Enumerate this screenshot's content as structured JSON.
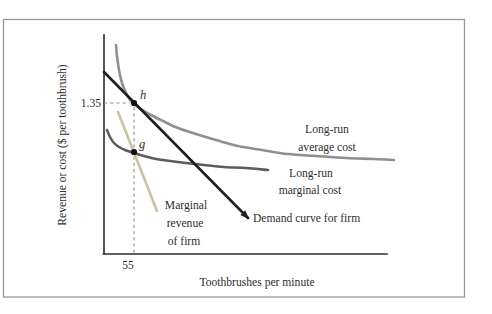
{
  "figure": {
    "y_axis_label": "Revenue or cost ($ per toothbrush)",
    "x_axis_label": "Toothbrushes per minute",
    "y_tick_label": "1.35",
    "x_tick_label": "55"
  },
  "labels": {
    "lrac": [
      "Long-run",
      "average cost"
    ],
    "lrmc": [
      "Long-run",
      "marginal cost"
    ],
    "demand": "Demand curve for firm",
    "mr": [
      "Marginal",
      "revenue",
      "of firm"
    ],
    "point_h": "h",
    "point_g": "g"
  },
  "colors": {
    "frame": "#999999",
    "axis": "#2b2b2b",
    "text": "#2e2e2e",
    "demand": "#1f1f1f",
    "lrac": "#8f8f8f",
    "lrmc": "#5c5c5c",
    "mr": "#c9c3a4",
    "dashed": "#8f8f8f",
    "dot": "#111111"
  },
  "chart_data": {
    "type": "line",
    "title": "",
    "xlabel": "Toothbrushes per minute",
    "ylabel": "Revenue or cost ($ per toothbrush)",
    "x_tick_values": [
      55
    ],
    "y_tick_values": [
      1.35
    ],
    "legend_position": "inline-annotations",
    "grid": false,
    "key_points": [
      {
        "label": "h",
        "x": 55,
        "y": 1.35,
        "px": [
          134,
          103
        ]
      },
      {
        "label": "g",
        "x": 55,
        "px": [
          134,
          152
        ]
      }
    ],
    "series": [
      {
        "name": "Long-run average cost",
        "color_key": "lrac",
        "shape": "decreasing convex curve, tangent to demand curve at point h",
        "points_px": [
          [
            116,
            45
          ],
          [
            117,
            56
          ],
          [
            119,
            70
          ],
          [
            122,
            83
          ],
          [
            127,
            95
          ],
          [
            133,
            103
          ],
          [
            141,
            109
          ],
          [
            151,
            115
          ],
          [
            163,
            121
          ],
          [
            178,
            128
          ],
          [
            196,
            134
          ],
          [
            216,
            140
          ],
          [
            238,
            146
          ],
          [
            262,
            150
          ],
          [
            288,
            154
          ],
          [
            316,
            156
          ],
          [
            346,
            158
          ],
          [
            374,
            159
          ],
          [
            394,
            160
          ]
        ]
      },
      {
        "name": "Long-run marginal cost",
        "color_key": "lrmc",
        "shape": "decreasing convex curve through point g, flattening to the right",
        "points_px": [
          [
            107,
            130
          ],
          [
            110,
            137
          ],
          [
            114,
            143
          ],
          [
            119,
            147
          ],
          [
            125,
            150
          ],
          [
            134,
            153
          ],
          [
            144,
            156
          ],
          [
            156,
            159
          ],
          [
            170,
            161
          ],
          [
            186,
            163
          ],
          [
            204,
            165
          ],
          [
            224,
            167
          ],
          [
            246,
            168
          ],
          [
            268,
            170
          ]
        ]
      },
      {
        "name": "Demand curve for firm",
        "color_key": "demand",
        "shape": "straight downward line through point h",
        "points_px": [
          [
            104,
            72
          ],
          [
            248,
            218
          ]
        ]
      },
      {
        "name": "Marginal revenue of firm",
        "color_key": "mr",
        "shape": "steeper straight downward line through point g",
        "points_px": [
          [
            118,
            112
          ],
          [
            157,
            211
          ]
        ]
      }
    ],
    "guides": {
      "h_dash": [
        [
          104,
          103
        ],
        [
          130,
          103
        ]
      ],
      "v_dash": [
        [
          134,
          107
        ],
        [
          134,
          254
        ]
      ]
    }
  }
}
